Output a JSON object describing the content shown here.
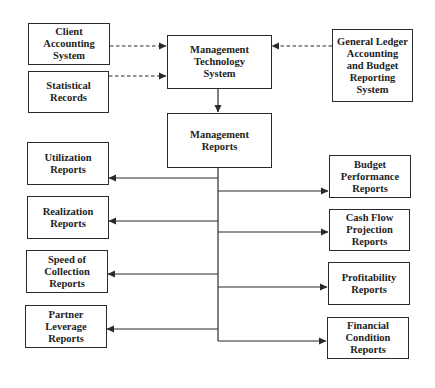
{
  "diagram": {
    "type": "flowchart",
    "colors": {
      "line": "#2a2a2a",
      "text": "#1e1e1e",
      "background": "#ffffff"
    },
    "sources": [
      {
        "id": "client",
        "label": "Client\nAccounting\nSystem"
      },
      {
        "id": "statistical",
        "label": "Statistical\nRecords"
      },
      {
        "id": "general_ledger",
        "label": "General Ledger\nAccounting\nand Budget\nReporting\nSystem"
      }
    ],
    "center": {
      "system": {
        "id": "mts",
        "label": "Management\nTechnology\nSystem"
      },
      "reports": {
        "id": "mr",
        "label": "Management\nReports"
      }
    },
    "left_reports": [
      {
        "id": "utilization",
        "label": "Utilization\nReports"
      },
      {
        "id": "realization",
        "label": "Realization\nReports"
      },
      {
        "id": "speed",
        "label": "Speed of\nCollection\nReports"
      },
      {
        "id": "partner",
        "label": "Partner\nLeverage\nReports"
      }
    ],
    "right_reports": [
      {
        "id": "budget",
        "label": "Budget\nPerformance\nReports"
      },
      {
        "id": "cashflow",
        "label": "Cash Flow\nProjection\nReports"
      },
      {
        "id": "profitability",
        "label": "Profitability\nReports"
      },
      {
        "id": "financial",
        "label": "Financial\nCondition\nReports"
      }
    ],
    "edges": [
      {
        "from": "client",
        "to": "mts",
        "style": "dashed"
      },
      {
        "from": "statistical",
        "to": "mts",
        "style": "dashed"
      },
      {
        "from": "general_ledger",
        "to": "mts",
        "style": "dashed"
      },
      {
        "from": "mts",
        "to": "mr",
        "style": "solid"
      },
      {
        "from": "mr",
        "to": "utilization",
        "style": "solid"
      },
      {
        "from": "mr",
        "to": "realization",
        "style": "solid"
      },
      {
        "from": "mr",
        "to": "speed",
        "style": "solid"
      },
      {
        "from": "mr",
        "to": "partner",
        "style": "solid"
      },
      {
        "from": "mr",
        "to": "budget",
        "style": "solid"
      },
      {
        "from": "mr",
        "to": "cashflow",
        "style": "solid"
      },
      {
        "from": "mr",
        "to": "profitability",
        "style": "solid"
      },
      {
        "from": "mr",
        "to": "financial",
        "style": "solid"
      }
    ]
  }
}
